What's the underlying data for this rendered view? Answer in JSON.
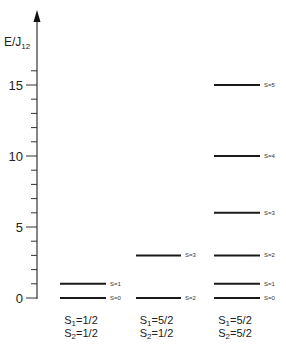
{
  "chart_data": {
    "type": "energy-level-diagram",
    "title": "",
    "ylabel": "E/J12",
    "ylabel_main": "E/J",
    "ylabel_sub": "12",
    "ylim": [
      0,
      16.5
    ],
    "yticks_major": [
      0,
      5,
      10,
      15
    ],
    "yticks_major_labels": [
      "0",
      "5",
      "10",
      "15"
    ],
    "yticks_minor_step": 1,
    "groups": [
      {
        "name": "S1=1/2, S2=1/2",
        "label_line1": {
          "main": "S",
          "sub": "1",
          "rest": "=1/2"
        },
        "label_line2": {
          "main": "S",
          "sub": "2",
          "rest": "=1/2"
        },
        "levels": [
          {
            "S": 0,
            "E": 0,
            "label": "S=0"
          },
          {
            "S": 1,
            "E": 1,
            "label": "S=1"
          }
        ]
      },
      {
        "name": "S1=5/2, S2=1/2",
        "label_line1": {
          "main": "S",
          "sub": "1",
          "rest": "=5/2"
        },
        "label_line2": {
          "main": "S",
          "sub": "2",
          "rest": "=1/2"
        },
        "levels": [
          {
            "S": 2,
            "E": 0,
            "label": "S=2"
          },
          {
            "S": 3,
            "E": 3,
            "label": "S=3"
          }
        ]
      },
      {
        "name": "S1=5/2, S2=5/2",
        "label_line1": {
          "main": "S",
          "sub": "1",
          "rest": "=5/2"
        },
        "label_line2": {
          "main": "S",
          "sub": "2",
          "rest": "=5/2"
        },
        "levels": [
          {
            "S": 0,
            "E": 0,
            "label": "S=0"
          },
          {
            "S": 1,
            "E": 1,
            "label": "S=1"
          },
          {
            "S": 2,
            "E": 3,
            "label": "S=2"
          },
          {
            "S": 3,
            "E": 6,
            "label": "S=3"
          },
          {
            "S": 4,
            "E": 10,
            "label": "S=4"
          },
          {
            "S": 5,
            "E": 15,
            "label": "S=5"
          }
        ]
      }
    ],
    "grid": false,
    "legend": "none"
  },
  "colors": {
    "line": "#1a1a1a",
    "axis": "#333333"
  }
}
